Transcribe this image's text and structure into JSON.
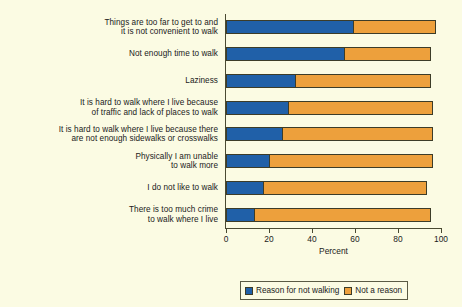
{
  "chart_data": {
    "type": "bar",
    "orientation": "horizontal",
    "stacked": true,
    "title": "",
    "xlabel": "Percent",
    "ylabel": "",
    "xlim": [
      0,
      100
    ],
    "xticks": [
      0,
      20,
      40,
      60,
      80,
      100
    ],
    "grid": false,
    "legend_position": "bottom",
    "categories": [
      "Things are too far to get to and\nit is not convenient to walk",
      "Not enough time to walk",
      "Laziness",
      "It is hard to walk where I live because\nof traffic and lack of places to walk",
      "It is hard to walk where I live because there\nare not enough sidewalks or crosswalks",
      "Physically I am unable\nto walk more",
      "I do not like to walk",
      "There is too much crime\nto walk where I live"
    ],
    "series": [
      {
        "name": "Reason for not walking",
        "color": "#2060a8",
        "values": [
          59,
          55,
          32,
          29,
          26,
          20,
          17,
          13
        ]
      },
      {
        "name": "Not a reason",
        "color": "#eda03c",
        "values": [
          38,
          40,
          63,
          67,
          70,
          76,
          76,
          82
        ]
      }
    ],
    "totals": [
      97,
      95,
      95,
      96,
      96,
      96,
      93,
      95
    ]
  },
  "axis": {
    "x_title": "Percent",
    "tick_labels": [
      "0",
      "20",
      "40",
      "60",
      "80",
      "100"
    ]
  },
  "legend": {
    "items": [
      {
        "label": "Reason for not walking",
        "color": "#2060a8"
      },
      {
        "label": "Not a reason",
        "color": "#eda03c"
      }
    ]
  },
  "colors": {
    "background": "#fbfbe3",
    "blue": "#2060a8",
    "orange": "#eda03c",
    "axis": "#4a4a32",
    "text": "#1a1a1a"
  }
}
